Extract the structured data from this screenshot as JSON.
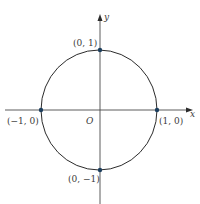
{
  "figure": {
    "colors": {
      "background": "#ffffff",
      "line": "#2b2b2b",
      "axis": "#4a4a4a",
      "point": "#1d3f5e",
      "text": "#3a3a3a"
    },
    "axes": {
      "x_label": "x",
      "y_label": "y",
      "origin_label": "O"
    },
    "circle": {
      "equation": "x^2 + y^2 = 1",
      "center": [
        0,
        0
      ],
      "radius": 1
    },
    "points": [
      {
        "label": "(0, 1)",
        "coords": [
          0,
          1
        ]
      },
      {
        "label": "(1, 0)",
        "coords": [
          1,
          0
        ]
      },
      {
        "label": "(0, −1)",
        "coords": [
          0,
          -1
        ]
      },
      {
        "label": "(−1, 0)",
        "coords": [
          -1,
          0
        ]
      }
    ]
  }
}
